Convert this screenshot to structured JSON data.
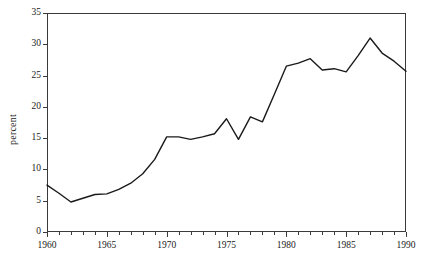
{
  "chart_data": {
    "type": "line",
    "title": "",
    "xlabel": "",
    "ylabel": "percent",
    "xlim": [
      1960,
      1990
    ],
    "ylim": [
      0,
      35
    ],
    "grid": false,
    "legend": false,
    "legend_position": "none",
    "line_color": "#1a1a1a",
    "x_major_ticks": [
      1960,
      1965,
      1970,
      1975,
      1980,
      1985,
      1990
    ],
    "x_major_tick_labels": [
      "1960",
      "1965",
      "1970",
      "1975",
      "1980",
      "1985",
      "1990"
    ],
    "x_minor_tick_interval": 1,
    "y_major_ticks": [
      0,
      5,
      10,
      15,
      20,
      25,
      30,
      35
    ],
    "y_major_tick_labels": [
      "0",
      "5",
      "10",
      "15",
      "20",
      "25",
      "30",
      "35"
    ],
    "x": [
      1960,
      1961,
      1962,
      1963,
      1964,
      1965,
      1966,
      1967,
      1968,
      1969,
      1970,
      1971,
      1972,
      1973,
      1974,
      1975,
      1976,
      1977,
      1978,
      1979,
      1980,
      1981,
      1982,
      1983,
      1984,
      1985,
      1986,
      1987,
      1988,
      1989,
      1990
    ],
    "values": [
      7.5,
      6.2,
      4.8,
      5.4,
      6.0,
      6.1,
      6.8,
      7.8,
      9.3,
      11.6,
      15.2,
      15.2,
      14.8,
      15.2,
      15.7,
      18.1,
      14.8,
      18.4,
      17.6,
      22.0,
      26.5,
      27.0,
      27.7,
      25.9,
      26.1,
      25.6,
      28.2,
      31.0,
      28.6,
      27.3,
      25.7
    ],
    "series": [
      {
        "name": "percent",
        "values": [
          7.5,
          6.2,
          4.8,
          5.4,
          6.0,
          6.1,
          6.8,
          7.8,
          9.3,
          11.6,
          15.2,
          15.2,
          14.8,
          15.2,
          15.7,
          18.1,
          14.8,
          18.4,
          17.6,
          22.0,
          26.5,
          27.0,
          27.7,
          25.9,
          26.1,
          25.6,
          28.2,
          31.0,
          28.6,
          27.3,
          25.7
        ]
      }
    ]
  }
}
